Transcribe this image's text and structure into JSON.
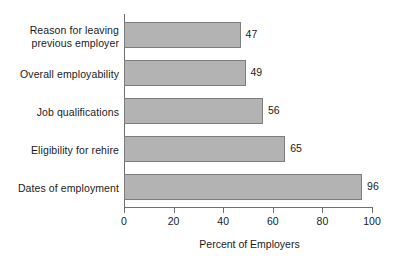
{
  "chart_data": {
    "type": "bar",
    "orientation": "horizontal",
    "title": "",
    "categories": [
      "Reason for leaving\nprevious employer",
      "Overall employability",
      "Job qualifications",
      "Eligibility for rehire",
      "Dates of employment"
    ],
    "values": [
      47,
      49,
      56,
      65,
      96
    ],
    "value_labels": [
      "47",
      "49",
      "56",
      "65",
      "96"
    ],
    "xlabel": "Percent of Employers",
    "ylabel": "",
    "xlim": [
      0,
      100
    ],
    "xticks": [
      0,
      20,
      40,
      60,
      80,
      100
    ],
    "xtick_labels": [
      "0",
      "20",
      "40",
      "60",
      "80",
      "100"
    ],
    "grid": false,
    "legend": null,
    "colors": {
      "bar_fill": "#b3b3b3",
      "bar_border": "#7d7d7d",
      "axis": "#6e6e6e",
      "text": "#1a1a1a",
      "background": "#ffffff"
    }
  }
}
